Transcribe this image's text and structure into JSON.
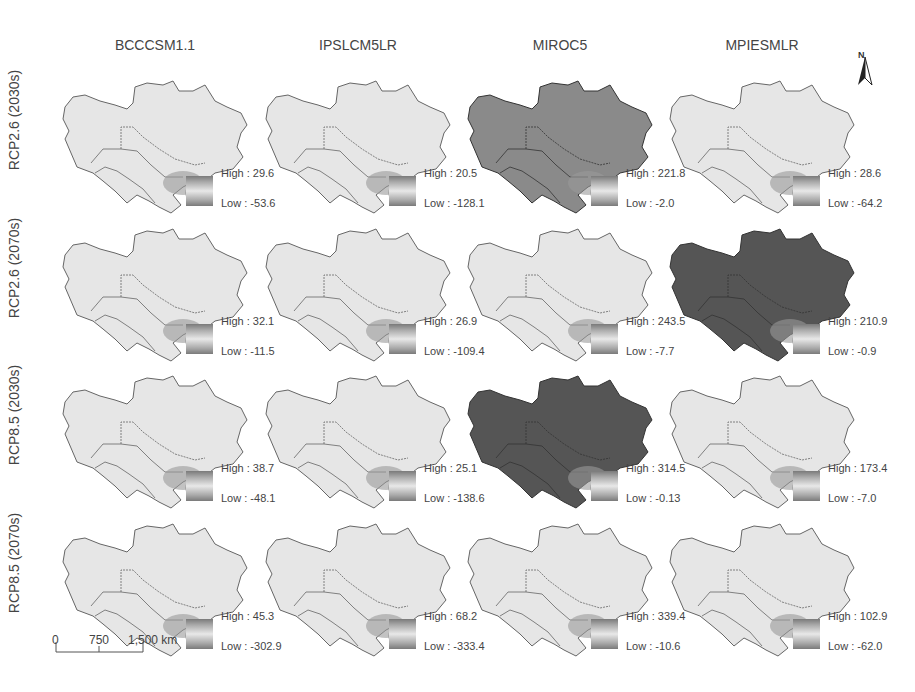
{
  "columns": [
    "BCCCSM1.1",
    "IPSLCM5LR",
    "MIROC5",
    "MPIESMLR"
  ],
  "rows": [
    "RCP2.6 (2030s)",
    "RCP2.6 (2070s)",
    "RCP8.5 (2030s)",
    "RCP8.5 (2070s)"
  ],
  "panels": [
    [
      {
        "high": "High : 29.6",
        "low": "Low : -53.6",
        "shade": "light"
      },
      {
        "high": "High : 20.5",
        "low": "Low : -128.1",
        "shade": "light"
      },
      {
        "high": "High : 221.8",
        "low": "Low : -2.0",
        "shade": "medium"
      },
      {
        "high": "High : 28.6",
        "low": "Low : -64.2",
        "shade": "light"
      }
    ],
    [
      {
        "high": "High : 32.1",
        "low": "Low : -11.5",
        "shade": "light"
      },
      {
        "high": "High : 26.9",
        "low": "Low : -109.4",
        "shade": "light"
      },
      {
        "high": "High : 243.5",
        "low": "Low : -7.7",
        "shade": "light"
      },
      {
        "high": "High : 210.9",
        "low": "Low : -0.9",
        "shade": "dark"
      }
    ],
    [
      {
        "high": "High : 38.7",
        "low": "Low : -48.1",
        "shade": "light"
      },
      {
        "high": "High : 25.1",
        "low": "Low : -138.6",
        "shade": "light"
      },
      {
        "high": "High : 314.5",
        "low": "Low : -0.13",
        "shade": "dark"
      },
      {
        "high": "High : 173.4",
        "low": "Low : -7.0",
        "shade": "light"
      }
    ],
    [
      {
        "high": "High : 45.3",
        "low": "Low : -302.9",
        "shade": "light"
      },
      {
        "high": "High : 68.2",
        "low": "Low : -333.4",
        "shade": "light"
      },
      {
        "high": "High : 339.4",
        "low": "Low : -10.6",
        "shade": "light"
      },
      {
        "high": "High : 102.9",
        "low": "Low : -62.0",
        "shade": "light"
      }
    ]
  ],
  "shade_colors": {
    "light": "#e6e6e6",
    "medium": "#8a8a8a",
    "dark": "#555555"
  },
  "north_arrow": {
    "label": "N"
  },
  "scale_bar": {
    "ticks": [
      "0",
      "750",
      "1,500 km"
    ]
  }
}
